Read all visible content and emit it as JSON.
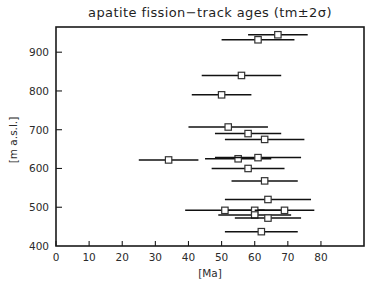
{
  "chart_data": {
    "type": "scatter",
    "title": "apatite fission−track ages (tm±2σ)",
    "xlabel": "[Ma]",
    "ylabel": "[m a.s.l.]",
    "xlim": [
      0,
      93
    ],
    "ylim": [
      400,
      965
    ],
    "grid": false,
    "legend": "none",
    "xticks": [
      0,
      10,
      20,
      30,
      40,
      50,
      60,
      70,
      80
    ],
    "xtick_labels": [
      "0",
      "10",
      "20",
      "30",
      "40",
      "50",
      "60",
      "70",
      "80"
    ],
    "yticks": [
      400,
      500,
      600,
      700,
      800,
      900
    ],
    "ytick_labels": [
      "400",
      "500",
      "600",
      "700",
      "800",
      "900"
    ],
    "error_notation": "tm±2σ",
    "marker": "open-square",
    "points": [
      {
        "age": 67,
        "elevation": 945,
        "err": 9
      },
      {
        "age": 61,
        "elevation": 932,
        "err": 11
      },
      {
        "age": 56,
        "elevation": 840,
        "err": 12
      },
      {
        "age": 50,
        "elevation": 790,
        "err": 9
      },
      {
        "age": 52,
        "elevation": 707,
        "err": 12
      },
      {
        "age": 58,
        "elevation": 690,
        "err": 10
      },
      {
        "age": 63,
        "elevation": 675,
        "err": 12
      },
      {
        "age": 34,
        "elevation": 622,
        "err": 9
      },
      {
        "age": 55,
        "elevation": 625,
        "err": 10
      },
      {
        "age": 61,
        "elevation": 628,
        "err": 13
      },
      {
        "age": 58,
        "elevation": 600,
        "err": 11
      },
      {
        "age": 63,
        "elevation": 568,
        "err": 10
      },
      {
        "age": 64,
        "elevation": 520,
        "err": 13
      },
      {
        "age": 51,
        "elevation": 492,
        "err": 12
      },
      {
        "age": 60,
        "elevation": 492,
        "err": 8
      },
      {
        "age": 69,
        "elevation": 492,
        "err": 9
      },
      {
        "age": 60,
        "elevation": 480,
        "err": 11
      },
      {
        "age": 64,
        "elevation": 472,
        "err": 10
      },
      {
        "age": 62,
        "elevation": 437,
        "err": 11
      }
    ]
  }
}
